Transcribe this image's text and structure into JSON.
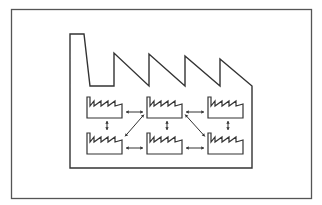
{
  "diagram": {
    "title": "",
    "stroke_color": "#333333",
    "frame_color": "#555555",
    "background": "#ffffff",
    "units": [
      {
        "id": "u1",
        "row": 0,
        "col": 0
      },
      {
        "id": "u2",
        "row": 0,
        "col": 1
      },
      {
        "id": "u3",
        "row": 0,
        "col": 2
      },
      {
        "id": "u4",
        "row": 1,
        "col": 0
      },
      {
        "id": "u5",
        "row": 1,
        "col": 1
      },
      {
        "id": "u6",
        "row": 1,
        "col": 2
      }
    ],
    "connections": [
      {
        "from": "u1",
        "to": "u2",
        "type": "bidirectional"
      },
      {
        "from": "u2",
        "to": "u3",
        "type": "bidirectional"
      },
      {
        "from": "u4",
        "to": "u5",
        "type": "bidirectional"
      },
      {
        "from": "u5",
        "to": "u6",
        "type": "bidirectional"
      },
      {
        "from": "u1",
        "to": "u4",
        "type": "bidirectional"
      },
      {
        "from": "u2",
        "to": "u5",
        "type": "bidirectional"
      },
      {
        "from": "u3",
        "to": "u6",
        "type": "bidirectional"
      },
      {
        "from": "u4",
        "to": "u2",
        "type": "bidirectional"
      },
      {
        "from": "u2",
        "to": "u6",
        "type": "bidirectional"
      }
    ]
  }
}
